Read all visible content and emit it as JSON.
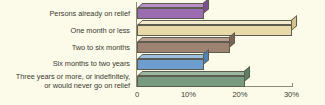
{
  "chart_data": {
    "type": "bar",
    "orientation": "horizontal",
    "title": "",
    "subtitle": "",
    "xlabel": "",
    "ylabel": "",
    "grid": false,
    "legend": "none",
    "xlim": [
      0,
      33
    ],
    "background_color": "#fcfbe9",
    "axis_color": "#8e8d77",
    "text_color": "#3b3a33",
    "tick_labels": [
      "0",
      "10%",
      "20%",
      "30%"
    ],
    "tick_values": [
      0,
      10,
      20,
      30
    ],
    "categories": [
      "Persons already on relief",
      "One month or less",
      "Two to six months",
      "Six months to two years",
      "Three years or more, or indefinitely,\nor would never go on relief"
    ],
    "values": [
      13,
      30,
      18,
      13,
      21
    ],
    "bar_colors": [
      "#9b6cb0",
      "#ead9a8",
      "#9e8272",
      "#6e9ed0",
      "#789b7f"
    ],
    "bar_top_colors": [
      "#b98fcb",
      "#f3e9cc",
      "#b89e90",
      "#9bbfe0",
      "#9bb7a0"
    ],
    "bar_side_colors": [
      "#7c4f93",
      "#d6c38a",
      "#7e6354",
      "#4f7fb3",
      "#5c8064"
    ]
  }
}
